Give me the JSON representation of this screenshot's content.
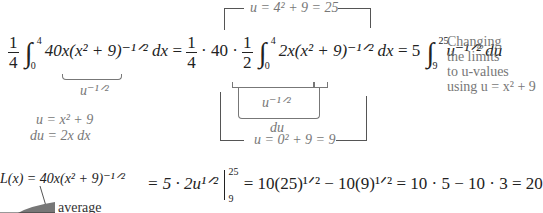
{
  "equation_top": {
    "lhs_coeff": {
      "num": "1",
      "den": "4"
    },
    "lhs_integral": {
      "lower": "0",
      "upper": "4"
    },
    "lhs_integrand": "40x(x² + 9)⁻¹ᐟ² dx",
    "lhs_underbrace_label": "u⁻¹ᐟ²",
    "mid_prefix": "= ",
    "mid_coeff1": {
      "num": "1",
      "den": "4"
    },
    "mid_dot": "· 40 ·",
    "mid_coeff2": {
      "num": "1",
      "den": "2"
    },
    "mid_integral": {
      "lower": "0",
      "upper": "4"
    },
    "mid_integrand": "2x(x² + 9)⁻¹ᐟ² dx",
    "mid_underbrace_label": "u⁻¹ᐟ²",
    "mid_du_label": "du",
    "rhs_prefix": "= 5",
    "rhs_integral": {
      "lower": "9",
      "upper": "25"
    },
    "rhs_integrand": "u⁻¹ᐟ² du"
  },
  "limit_annotations": {
    "upper": "u = 4² + 9 = 25",
    "lower": "u = 0² + 9 = 9"
  },
  "substitution": {
    "line1": "u = x² + 9",
    "line2": "du = 2x dx"
  },
  "side_note": {
    "lines": [
      "Changing",
      "the limits",
      "to u-values",
      "using  u = x² + 9"
    ]
  },
  "equation_bottom": {
    "expr": "= 5 · 2u¹ᐟ²",
    "eval_upper": "25",
    "eval_lower": "9",
    "rest": "= 10(25)¹ᐟ² − 10(9)¹ᐟ² = 10 · 5 − 10 · 3 = 20"
  },
  "graph": {
    "function_label": "L(x) = 40x(x² + 9)⁻¹ᐟ²",
    "average_label": "average"
  }
}
